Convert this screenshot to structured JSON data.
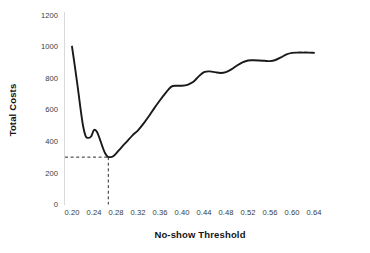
{
  "chart_data": {
    "type": "line",
    "title": "",
    "xlabel": "No-show Threshold",
    "ylabel": "Total Costs",
    "xlim": [
      0.19,
      0.65
    ],
    "ylim": [
      0,
      1200
    ],
    "grid": false,
    "legend": "none",
    "x_ticks": [
      "0.20",
      "0.24",
      "0.28",
      "0.32",
      "0.36",
      "0.40",
      "0.44",
      "0.48",
      "0.52",
      "0.56",
      "0.60",
      "0.64"
    ],
    "y_ticks": [
      "0",
      "200",
      "400",
      "600",
      "800",
      "1000",
      "1200"
    ],
    "series": [
      {
        "name": "Total Costs",
        "x": [
          0.2,
          0.205,
          0.21,
          0.215,
          0.22,
          0.225,
          0.23,
          0.235,
          0.24,
          0.245,
          0.25,
          0.255,
          0.26,
          0.265,
          0.27,
          0.275,
          0.28,
          0.29,
          0.3,
          0.31,
          0.32,
          0.33,
          0.34,
          0.35,
          0.36,
          0.37,
          0.38,
          0.39,
          0.4,
          0.41,
          0.42,
          0.43,
          0.44,
          0.45,
          0.46,
          0.47,
          0.48,
          0.49,
          0.5,
          0.51,
          0.52,
          0.53,
          0.54,
          0.55,
          0.56,
          0.57,
          0.58,
          0.59,
          0.6,
          0.61,
          0.62,
          0.63,
          0.64
        ],
        "y": [
          1000,
          880,
          755,
          620,
          500,
          432,
          422,
          432,
          472,
          462,
          420,
          370,
          326,
          303,
          300,
          306,
          322,
          362,
          400,
          438,
          470,
          512,
          560,
          612,
          660,
          705,
          745,
          752,
          752,
          758,
          775,
          810,
          838,
          843,
          838,
          833,
          838,
          856,
          880,
          900,
          912,
          913,
          912,
          910,
          908,
          915,
          932,
          950,
          960,
          962,
          962,
          962,
          960
        ]
      }
    ],
    "annotations": {
      "optimum_marker": {
        "x": 0.266,
        "y": 300,
        "style": "dashed-guide-lines",
        "label": ""
      }
    }
  },
  "axis": {
    "y_title": "Total Costs",
    "x_title": "No-show Threshold"
  }
}
